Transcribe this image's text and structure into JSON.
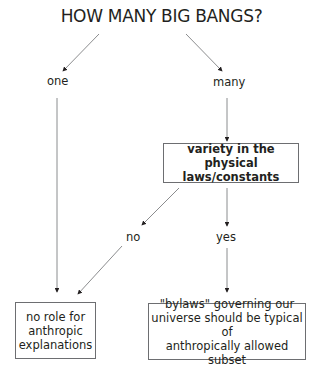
{
  "title": "HOW MANY BIG BANGS?",
  "branches": {
    "one": "one",
    "many": "many",
    "no": "no",
    "yes": "yes"
  },
  "nodes": {
    "variety_box": {
      "line1": "variety in the",
      "line2": "physical laws/constants"
    },
    "no_role_box": {
      "line1": "no role for",
      "line2": "anthropic",
      "line3": "explanations"
    },
    "bylaws_box": {
      "line1": "\"bylaws\" governing our",
      "line2": "universe should be typical of",
      "line3": "anthropically allowed subset"
    }
  },
  "colors": {
    "text": "#231f20",
    "line": "#6d6e71"
  }
}
